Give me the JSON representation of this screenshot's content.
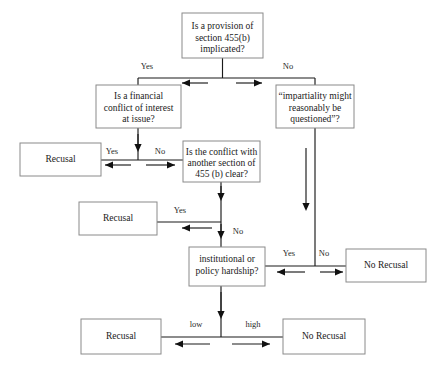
{
  "diagram": {
    "colors": {
      "box_border": "#8a8a8a",
      "line": "#1a1a1a",
      "text": "#1a1a1a",
      "background": "#ffffff"
    },
    "nodes": [
      {
        "id": "provision",
        "label": "Is a provision of\nsection 455(b)\nimplicated?",
        "lines": [
          "Is a provision of",
          "section 455(b)",
          "implicated?"
        ],
        "x": 182,
        "y": 13,
        "w": 81,
        "h": 45,
        "type": "decision"
      },
      {
        "id": "financial",
        "label": "Is a financial\nconflict of interest\nat issue?",
        "lines": [
          "Is a financial",
          "conflict of interest",
          "at issue?"
        ],
        "x": 96,
        "y": 85,
        "w": 85,
        "h": 43,
        "type": "decision"
      },
      {
        "id": "impartiality",
        "label": "“impartiality might\nreasonably be\nquestioned”?",
        "lines": [
          "“impartiality might",
          "reasonably be",
          "questioned”?"
        ],
        "x": 276,
        "y": 85,
        "w": 78,
        "h": 43,
        "type": "decision"
      },
      {
        "id": "recusal1",
        "label": "Recusal",
        "lines": [
          "Recusal"
        ],
        "x": 20,
        "y": 143,
        "w": 81,
        "h": 33,
        "type": "outcome"
      },
      {
        "id": "conflict",
        "label": "Is the conflict with\nanother section of\n455 (b) clear?",
        "lines": [
          "Is the conflict with",
          "another section of",
          "455 (b) clear?"
        ],
        "x": 183,
        "y": 141,
        "w": 77,
        "h": 41,
        "type": "decision"
      },
      {
        "id": "recusal2",
        "label": "Recusal",
        "lines": [
          "Recusal"
        ],
        "x": 79,
        "y": 202,
        "w": 78,
        "h": 33,
        "type": "outcome"
      },
      {
        "id": "hardship",
        "label": "institutional or\npolicy hardship?",
        "lines": [
          "institutional or",
          "policy hardship?"
        ],
        "x": 189,
        "y": 247,
        "w": 76,
        "h": 39,
        "type": "decision"
      },
      {
        "id": "norecusal1",
        "label": "No Recusal",
        "lines": [
          "No Recusal"
        ],
        "x": 346,
        "y": 249,
        "w": 80,
        "h": 33,
        "type": "outcome"
      },
      {
        "id": "recusal3",
        "label": "Recusal",
        "lines": [
          "Recusal"
        ],
        "x": 81,
        "y": 319,
        "w": 80,
        "h": 35,
        "type": "outcome"
      },
      {
        "id": "norecusal2",
        "label": "No Recusal",
        "lines": [
          "No Recusal"
        ],
        "x": 283,
        "y": 319,
        "w": 82,
        "h": 35,
        "type": "outcome"
      }
    ],
    "edge_labels": [
      {
        "id": "lbl-yes-1",
        "text": "Yes",
        "x": 147,
        "y": 67
      },
      {
        "id": "lbl-no-1",
        "text": "No",
        "x": 288,
        "y": 67
      },
      {
        "id": "lbl-yes-2",
        "text": "Yes",
        "x": 112,
        "y": 152
      },
      {
        "id": "lbl-no-2",
        "text": "No",
        "x": 160,
        "y": 152
      },
      {
        "id": "lbl-yes-3",
        "text": "Yes",
        "x": 180,
        "y": 211
      },
      {
        "id": "lbl-no-3",
        "text": "No",
        "x": 238,
        "y": 232
      },
      {
        "id": "lbl-yes-4",
        "text": "Yes",
        "x": 289,
        "y": 254
      },
      {
        "id": "lbl-no-4",
        "text": "No",
        "x": 324,
        "y": 254
      },
      {
        "id": "lbl-low",
        "text": "low",
        "x": 196,
        "y": 325
      },
      {
        "id": "lbl-high",
        "text": "high",
        "x": 253,
        "y": 325
      }
    ]
  }
}
